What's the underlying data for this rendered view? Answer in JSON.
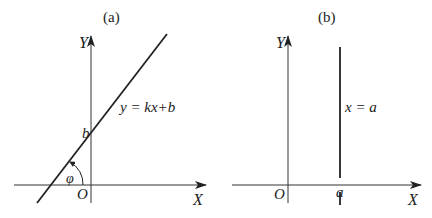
{
  "panel_a": {
    "caption": "(a)",
    "y_axis_label": "Y",
    "x_axis_label": "X",
    "origin_label": "O",
    "intercept_label": "b",
    "angle_label": "φ",
    "equation": "y = kx+b"
  },
  "panel_b": {
    "caption": "(b)",
    "y_axis_label": "Y",
    "x_axis_label": "X",
    "origin_label": "O",
    "point_label": "a",
    "equation": "x = a"
  },
  "colors": {
    "line": "#222222",
    "axis": "#333333"
  }
}
